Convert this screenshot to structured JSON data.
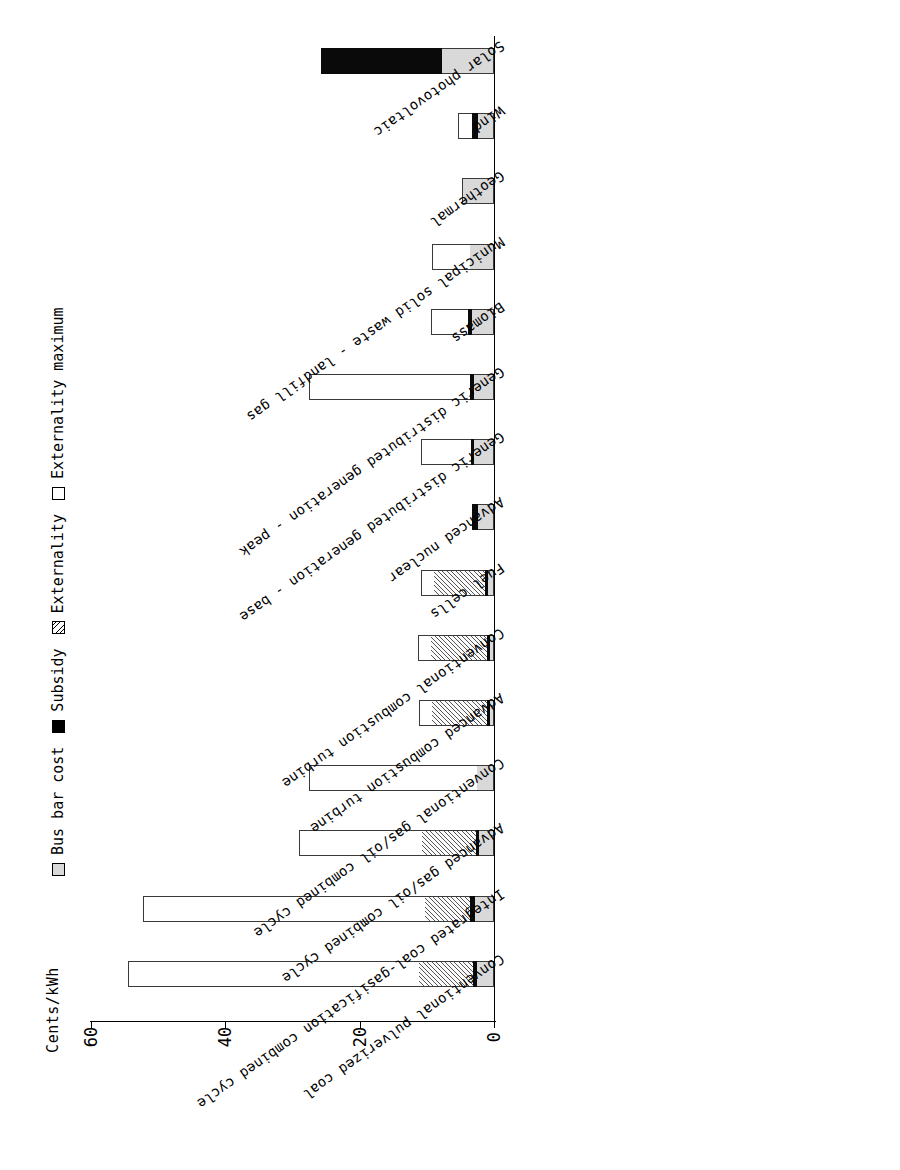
{
  "chart_data": {
    "type": "bar",
    "orientation": "horizontal-stacked",
    "title": "",
    "xlabel": "",
    "ylabel": "Cents/kWh",
    "axis_title": "Cents/kWh",
    "value_ticks": [
      60,
      40,
      20,
      0
    ],
    "value_tick_labels": [
      "60",
      "40",
      "20",
      "0"
    ],
    "xlim": [
      0,
      62
    ],
    "grid": false,
    "legend_position": "left-rotated",
    "stacked": true,
    "categories": [
      "Conventional pulverized coal",
      "Integrated coal-gasification combined cycle",
      "Advanced gas/oil combined cycle",
      "Conventional gas/oil combined cycle",
      "Advanced combustion turbine",
      "Conventional combustion turbine",
      "Fuel cells",
      "Advanced nuclear",
      "Generic distributed generation - base",
      "Generic distributed generation - peak",
      "Biomass",
      "Municipal solid waste - landfill gas",
      "Geothermal",
      "Wind",
      "Solar photovoltaic"
    ],
    "series": [
      {
        "name": "Bus bar cost",
        "color": "#d9d9d9",
        "values": [
          2.6,
          2.9,
          2.3,
          2.6,
          0.6,
          0.6,
          0.9,
          2.4,
          3.0,
          3.0,
          3.3,
          3.6,
          4.8,
          2.4,
          7.7
        ]
      },
      {
        "name": "Subsidy",
        "color": "#000000",
        "values": [
          0.6,
          0.6,
          0.4,
          0.0,
          0.5,
          0.4,
          0.5,
          0.9,
          0.4,
          0.5,
          0.5,
          0.0,
          0.0,
          0.9,
          18.0
        ]
      },
      {
        "name": "Externality",
        "color": "#b3b3b3",
        "values": [
          8.0,
          6.8,
          8.0,
          0.0,
          8.1,
          8.4,
          7.5,
          0.0,
          0.0,
          0.0,
          0.0,
          0.0,
          0.0,
          0.0,
          0.0
        ]
      },
      {
        "name": "Externality maximum",
        "color": "#ffffff",
        "values": [
          43.3,
          41.9,
          18.3,
          25.0,
          1.9,
          1.9,
          2.0,
          0.0,
          7.4,
          24.1,
          5.6,
          5.6,
          0.0,
          2.0,
          0.0
        ]
      }
    ]
  },
  "legend": {
    "entries": [
      {
        "label": "Bus bar cost",
        "swatch": "busbar-swatch"
      },
      {
        "label": "Subsidy",
        "swatch": "subsidy-swatch"
      },
      {
        "label": "Externality",
        "swatch": "externality-swatch"
      },
      {
        "label": "Externality maximum",
        "swatch": "externality-maximum-swatch"
      }
    ]
  }
}
